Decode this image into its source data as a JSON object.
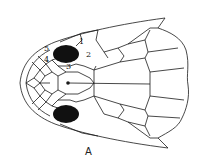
{
  "figure": {
    "caption": "A",
    "line_color": "#1a1a1a",
    "eye_color": "#111111",
    "scale_labels": [
      {
        "id": "1",
        "text": "1"
      },
      {
        "id": "2",
        "text": "2"
      },
      {
        "id": "3",
        "text": "3"
      },
      {
        "id": "4",
        "text": "4"
      },
      {
        "id": "5",
        "text": "5"
      }
    ]
  }
}
